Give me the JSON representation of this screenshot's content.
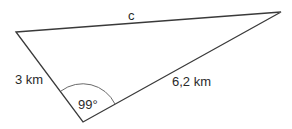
{
  "diagram": {
    "type": "triangle",
    "vertices": {
      "left": [
        16,
        32
      ],
      "top_right": [
        281,
        12
      ],
      "bottom": [
        83,
        122
      ]
    },
    "labels": {
      "side_c": "c",
      "side_left": "3 km",
      "side_right": "6,2 km",
      "angle": "99°"
    },
    "colors": {
      "stroke": "#3a3a3a",
      "arc": "#6a6a6a",
      "text": "#2a2a2a"
    }
  }
}
